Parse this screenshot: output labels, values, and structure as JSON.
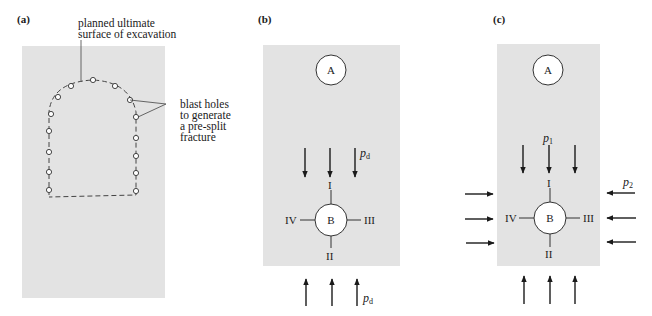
{
  "figure": {
    "panels": [
      {
        "id": "a",
        "label": "(a)",
        "annotations": {
          "surface_line1": "planned ultimate",
          "surface_line2": "surface of excavation",
          "holes_line1": "blast holes",
          "holes_line2": "to generate",
          "holes_line3": "a pre-split",
          "holes_line4": "fracture"
        },
        "hole_count": 15
      },
      {
        "id": "b",
        "label": "(b)",
        "openings": {
          "upper": "A",
          "lower": "B"
        },
        "positions": {
          "top": "I",
          "bottom": "II",
          "right": "III",
          "left": "IV"
        },
        "loads": {
          "vertical_symbol": "p",
          "vertical_subscript": "d",
          "vertical_arrows_top": 3,
          "vertical_arrows_bottom": 3
        }
      },
      {
        "id": "c",
        "label": "(c)",
        "openings": {
          "upper": "A",
          "lower": "B"
        },
        "positions": {
          "top": "I",
          "bottom": "II",
          "right": "III",
          "left": "IV"
        },
        "loads": {
          "vertical_symbol": "p",
          "vertical_subscript": "1",
          "horizontal_symbol": "p",
          "horizontal_subscript": "2",
          "vertical_arrows_top": 3,
          "vertical_arrows_bottom": 3,
          "horizontal_arrows_left": 3,
          "horizontal_arrows_right": 3
        }
      }
    ],
    "colors": {
      "rock_fill": "#e3e3e3",
      "line": "#1a1a1a",
      "background": "#ffffff"
    }
  }
}
